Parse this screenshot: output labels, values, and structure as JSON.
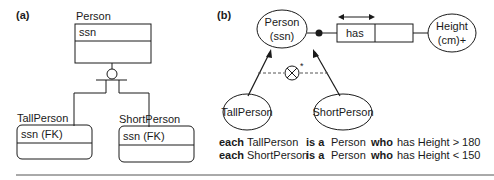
{
  "panel_a": {
    "label": "(a)",
    "supertype": {
      "name": "Person",
      "attribute": "ssn"
    },
    "subtypes": [
      {
        "name": "TallPerson",
        "attribute": "ssn (FK)"
      },
      {
        "name": "ShortPerson",
        "attribute": "ssn (FK)"
      }
    ]
  },
  "panel_b": {
    "label": "(b)",
    "supertype": {
      "line1": "Person",
      "line2": "(ssn)"
    },
    "fact_role": "has",
    "value_type": {
      "line1": "Height",
      "line2": "(cm)+"
    },
    "subtypes": [
      "TallPerson",
      "ShortPerson"
    ],
    "exclusion_mark": "*",
    "rules": [
      {
        "k1": "each",
        "t1": "TallPerson",
        "k2": "is a",
        "t2": "Person",
        "k3": "who",
        "t3": "has Height > 180"
      },
      {
        "k1": "each",
        "t1": "ShortPerson",
        "k2": "is a",
        "t2": "Person",
        "k3": "who",
        "t3": "has Height < 150"
      }
    ]
  },
  "colors": {
    "ink": "#1a1a1a",
    "rule": "#555555",
    "background": "#ffffff"
  }
}
